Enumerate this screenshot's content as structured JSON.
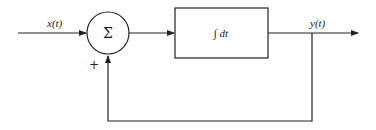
{
  "diagram": {
    "type": "block-diagram",
    "input_signal": {
      "label": "x(t)"
    },
    "summing_junction": {
      "symbol": "Σ",
      "feedback_sign": "+"
    },
    "integrator_block": {
      "label": "∫ dt"
    },
    "output_signal": {
      "label": "y(t)"
    },
    "colors": {
      "stroke": "#222222",
      "background": "#ffffff"
    }
  }
}
